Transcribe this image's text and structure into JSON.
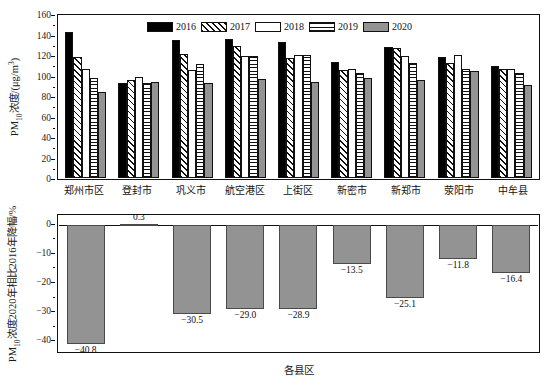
{
  "chart_data": [
    {
      "type": "bar",
      "panel": "top",
      "title": "",
      "xlabel": "",
      "ylabel": "PM10浓度/(μg/m3)",
      "ylim": [
        0,
        160
      ],
      "yticks": [
        0,
        20,
        40,
        60,
        80,
        100,
        120,
        140,
        160
      ],
      "grid": false,
      "legend_position": "top-center",
      "categories": [
        "郑州市区",
        "登封市",
        "巩义市",
        "航空港区",
        "上街区",
        "新密市",
        "新郑市",
        "荥阳市",
        "中牟县"
      ],
      "series": [
        {
          "name": "2016",
          "fill": "solid-black",
          "color": "#000000",
          "values": [
            142,
            93,
            135,
            136,
            133,
            113,
            128,
            118,
            109
          ]
        },
        {
          "name": "2017",
          "fill": "diagonal-hatch",
          "color": "#ffffff",
          "values": [
            118,
            96,
            121,
            129,
            117,
            105,
            127,
            112,
            106
          ]
        },
        {
          "name": "2018",
          "fill": "empty-white",
          "color": "#ffffff",
          "values": [
            106,
            99,
            105,
            119,
            120,
            106,
            119,
            120,
            106
          ]
        },
        {
          "name": "2019",
          "fill": "horizontal-lines",
          "color": "#ffffff",
          "values": [
            98,
            93,
            111,
            119,
            120,
            102,
            112,
            106,
            102
          ]
        },
        {
          "name": "2020",
          "fill": "solid-gray",
          "color": "#939393",
          "values": [
            84,
            94,
            93,
            97,
            94,
            98,
            96,
            104,
            91
          ]
        }
      ]
    },
    {
      "type": "bar",
      "panel": "bottom",
      "title": "",
      "xlabel": "各县区",
      "ylabel": "PM10浓度2020年相比2016年降幅/%",
      "ylim": [
        -44,
        3
      ],
      "yticks": [
        0,
        -10,
        -20,
        -30,
        -40
      ],
      "grid": false,
      "categories": [
        "郑州市区",
        "登封市",
        "巩义市",
        "航空港区",
        "上街区",
        "新密市",
        "新郑市",
        "荥阳市",
        "中牟县"
      ],
      "values": [
        -40.8,
        0.3,
        -30.5,
        -29.0,
        -28.9,
        -13.5,
        -25.1,
        -11.8,
        -16.4
      ],
      "labels": [
        "−40.8",
        "0.3",
        "−30.5",
        "−29.0",
        "−28.9",
        "−13.5",
        "−25.1",
        "−11.8",
        "−16.4"
      ],
      "bar_color": "#939393"
    }
  ],
  "top": {
    "ylabel_prefix": "PM",
    "ylabel_sub": "10",
    "ylabel_mid": "浓度/(μg/m",
    "ylabel_sup": "3",
    "ylabel_suffix": ")",
    "yticks": [
      "160",
      "140",
      "120",
      "100",
      "80",
      "60",
      "40",
      "20",
      "0"
    ],
    "legend": [
      {
        "label": "2016",
        "swatch": "b2016"
      },
      {
        "label": "2017",
        "swatch": "b2017"
      },
      {
        "label": "2018",
        "swatch": "b2018"
      },
      {
        "label": "2019",
        "swatch": "b2019"
      },
      {
        "label": "2020",
        "swatch": "b2020"
      }
    ],
    "categories": [
      "郑州市区",
      "登封市",
      "巩义市",
      "航空港区",
      "上街区",
      "新密市",
      "新郑市",
      "荥阳市",
      "中牟县"
    ]
  },
  "bottom": {
    "ylabel_prefix": "PM",
    "ylabel_sub": "10",
    "ylabel_suffix": "浓度2020年相比2016年降幅/%",
    "yticks": [
      "0",
      "−10",
      "−20",
      "−30",
      "−40"
    ],
    "xtitle": "各县区",
    "labels": [
      "−40.8",
      "0.3",
      "−30.5",
      "−29.0",
      "−28.9",
      "−13.5",
      "−25.1",
      "−11.8",
      "−16.4"
    ]
  }
}
